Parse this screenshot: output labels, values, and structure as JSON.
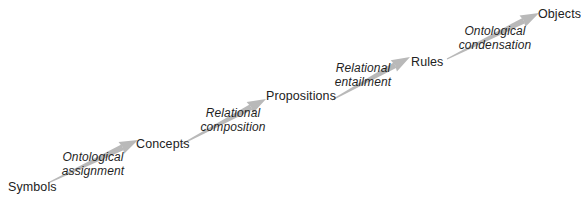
{
  "diagram": {
    "type": "flow-sequence",
    "background_color": "#ffffff",
    "arrow_color": "#b9b9b9",
    "text_color": "#222222",
    "stages": [
      {
        "label": "Symbols",
        "x": 8,
        "y": 180
      },
      {
        "label": "Concepts",
        "x": 136,
        "y": 137
      },
      {
        "label": "Propositions",
        "x": 266,
        "y": 89
      },
      {
        "label": "Rules",
        "x": 411,
        "y": 55
      },
      {
        "label": "Objects",
        "x": 538,
        "y": 7
      }
    ],
    "transitions": [
      {
        "line1": "Ontological",
        "line2": "assignment",
        "from": "Symbols",
        "to": "Concepts",
        "label_x": 60,
        "label_y": 151,
        "label_w": 66,
        "arrow": {
          "x1": 48,
          "y1": 183,
          "x2": 138,
          "y2": 140
        }
      },
      {
        "line1": "Relational",
        "line2": "composition",
        "from": "Concepts",
        "to": "Propositions",
        "label_x": 198,
        "label_y": 107,
        "label_w": 70,
        "arrow": {
          "x1": 182,
          "y1": 144,
          "x2": 266,
          "y2": 99
        }
      },
      {
        "line1": "Relational",
        "line2": "entailment",
        "from": "Propositions",
        "to": "Rules",
        "label_x": 330,
        "label_y": 62,
        "label_w": 66,
        "arrow": {
          "x1": 332,
          "y1": 100,
          "x2": 410,
          "y2": 57
        }
      },
      {
        "line1": "Ontological",
        "line2": "condensation",
        "from": "Rules",
        "to": "Objects",
        "label_x": 458,
        "label_y": 25,
        "label_w": 74,
        "arrow": {
          "x1": 447,
          "y1": 59,
          "x2": 539,
          "y2": 13
        }
      }
    ]
  }
}
